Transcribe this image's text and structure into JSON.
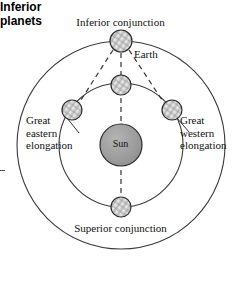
{
  "figure": {
    "caption": "Inferior\nplanets",
    "center_body": {
      "name": "Sun",
      "label": "Sun",
      "fill": "#9b9b9b",
      "stroke": "#2b2b2b",
      "cx": 121,
      "cy": 145,
      "r": 21
    },
    "orbits": [
      {
        "name": "inferior-planet-orbit",
        "cx": 121,
        "cy": 145,
        "r": 62,
        "stroke": "#3a3a3a"
      },
      {
        "name": "earth-orbit",
        "cx": 121,
        "cy": 145,
        "r": 104,
        "stroke": "#3a3a3a"
      }
    ],
    "bodies": [
      {
        "name": "earth-inferior-conjunction",
        "label": "Inferior conjunction",
        "cx": 121,
        "cy": 41,
        "r": 11,
        "fill": "#c9c9c9"
      },
      {
        "name": "planet-inferior-conjunction",
        "label": "",
        "cx": 121,
        "cy": 85,
        "r": 10,
        "fill": "#d8d8d8"
      },
      {
        "name": "planet-great-eastern-elongation",
        "label": "Great eastern elongation",
        "cx": 72,
        "cy": 110,
        "r": 10,
        "fill": "#c4c4c4"
      },
      {
        "name": "planet-great-western-elongation",
        "label": "Great western elongation",
        "cx": 172,
        "cy": 110,
        "r": 10,
        "fill": "#cccccc"
      },
      {
        "name": "planet-superior-conjunction",
        "label": "Superior conjunction",
        "cx": 121,
        "cy": 207,
        "r": 10,
        "fill": "#d0d0d0"
      }
    ],
    "sight_lines": [
      {
        "name": "sightline-earth-to-eastern",
        "x1": 112,
        "y1": 48,
        "x2": 80,
        "y2": 103,
        "style": "dashed"
      },
      {
        "name": "sightline-earth-to-sun",
        "x1": 121,
        "y1": 52,
        "x2": 121,
        "y2": 197,
        "style": "dashed"
      },
      {
        "name": "sightline-earth-to-western",
        "x1": 130,
        "y1": 48,
        "x2": 164,
        "y2": 103,
        "style": "dashed"
      }
    ],
    "leader_lines": [
      {
        "name": "leader-great-eastern",
        "x1": 66,
        "y1": 118,
        "x2": 78,
        "y2": 132
      },
      {
        "name": "leader-great-western",
        "x1": 177,
        "y1": 118,
        "x2": 188,
        "y2": 131
      }
    ],
    "labels": {
      "inferior_conjunction": "Inferior conjunction",
      "earth": "Earth",
      "superior_conjunction": "Superior conjunction",
      "great_eastern_elongation": "Great\neastern\nelongation",
      "great_western_elongation": "Great\nwestern\nelongation",
      "sun": "Sun"
    },
    "colors": {
      "background": "#ffffff",
      "line": "#3a3a3a",
      "sun_fill": "#9b9b9b",
      "text": "#111111"
    }
  }
}
